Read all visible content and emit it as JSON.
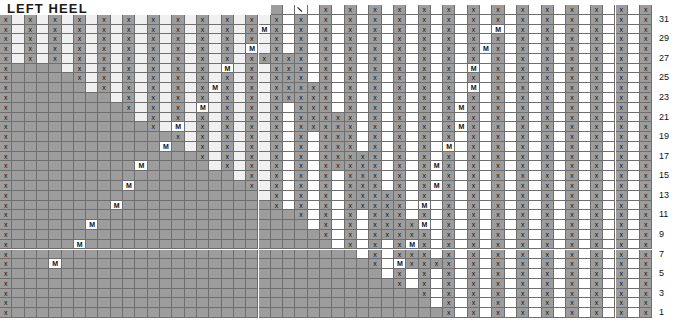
{
  "title": "LEFT HEEL",
  "chart_data": {
    "type": "table",
    "title": "LEFT HEEL",
    "columns": 53,
    "rows": 32,
    "row_labels_side": "right",
    "row_labels": [
      "31",
      "29",
      "27",
      "25",
      "23",
      "21",
      "19",
      "17",
      "15",
      "13",
      "11",
      "9",
      "7",
      "5",
      "3",
      "1"
    ],
    "symbol_legend": {
      "x": "knit-stitch",
      "M": "make-one-increase",
      "\\": "decrease-left-slant",
      "": "blank-stitch"
    },
    "colors": {
      "cell_gray": "#9d9d9d",
      "cell_light": "#f0f0f0",
      "cell_white": "#ffffff",
      "grid_line": "#6e6e6e",
      "text": "#111111"
    },
    "grid": [
      "            x\\x x x x x x x x xxx x x x x x x",
      "x x x x x xxx x x x x x x x x x xxx x x x x x x",
      "x x x x x xMx x x x x x x x x x xxMx x x x x x x",
      "x x x x x xx x x x x x x x x x  xxx x x x x x x",
      "x x x x xMx x x x x x x x x x xMxx x x x x x x",
      "x x x x x x x x x x x x x x  x xxx x x x x x x",
      "x x x x Mxx xxxx x x x x x xMx xx x x x x x x",
      "x x x xMx x xxxx x x x x x x xxx x x x x x x",
      "x x x x x x xxxxxx x x x xMxx x x x x x x",
      "x x xMx x xxxxxx x x x x xxx x x x x x x",
      "x x x x x xxxxxxx x x xMxx x x x x x x",
      "x xMx x x xxxxxxx x x x xxx x x x x x x",
      "x x x x xxxxxxxx x xMxx x x x x x x",
      "xMx x x xxxxxxxx x x xxx x x x x xMx",
      "x x x xxxxxxxxx xMxx x x x x xx x",
      "Mx x x xxxxxxxxx x xxx x x x xMx x",
      "x x x xxxxxxxxxx xx x x xMxx x",
      "x x xxxxxxxxxxx xxx x xMx x x",
      "x x xxxxxxxxxxxx x x xMxx x x",
      "x xxxxxxxxxxxxx xx xMx x x x",
      "x xxxxxxxxxxxxxx xMxx x x x",
      "xxxxxxxxxxxxxxx x xxMx x x x",
      "xxxxxxxxxxxxxxxx xxx Mx x x",
      "xxxxxxxxxxxxxxxxx xx xMx x",
      "x x xxxxxxx x x x x x",
      "x xMx x x x x x",
      "x x x x x x x",
      "x Mx x x x x",
      "x x x x x",
      "xM x x x x",
      "x x x x",
      "M x x M"
    ]
  }
}
